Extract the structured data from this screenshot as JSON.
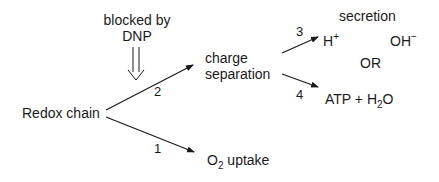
{
  "diagram": {
    "nodes": {
      "blocked_by_line1": "blocked by",
      "blocked_by_line2": "DNP",
      "redox_chain": "Redox chain",
      "charge_separation_line1": "charge",
      "charge_separation_line2": "separation",
      "o2_uptake": {
        "base": "O",
        "sub": "2",
        "rest": " uptake"
      },
      "secretion": "secretion",
      "h_plus": {
        "base": "H",
        "sup": "+"
      },
      "oh_minus": {
        "base": "OH",
        "sup": "−"
      },
      "or": "OR",
      "atp_h2o": {
        "prefix": "ATP + H",
        "sub": "2",
        "suffix": "O"
      }
    },
    "edges": [
      {
        "label": "1",
        "from": "Redox chain",
        "to": "O2 uptake"
      },
      {
        "label": "2",
        "from": "Redox chain",
        "to": "charge separation"
      },
      {
        "label": "3",
        "from": "charge separation",
        "to": "H+ secretion"
      },
      {
        "label": "4",
        "from": "charge separation",
        "to": "ATP + H2O"
      }
    ],
    "inhibition": {
      "target_edge": "2",
      "agent": "DNP",
      "symbol": "double-arrow-down"
    }
  }
}
